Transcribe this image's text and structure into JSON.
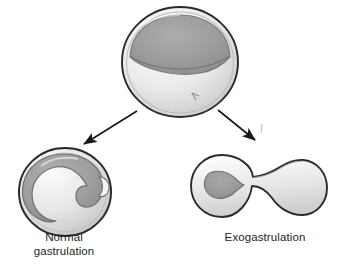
{
  "figure": {
    "background_color": "#ffffff",
    "width": 353,
    "height": 268
  },
  "palette": {
    "outline_dark": "#2b2b2b",
    "outline_mid": "#6e6e6e",
    "outline_light": "#8d8d8d",
    "shell_light": "#f2f2f2",
    "shell_mid": "#d8d8d8",
    "interior_gray": "#9a9a9a",
    "interior_dark": "#8a8a8a",
    "arrow_color": "#1a1a1a",
    "text_color": "#231f20"
  },
  "structures": {
    "blastula": {
      "name": "blastula",
      "label": "",
      "center_x": 180,
      "center_y": 62,
      "radius_x": 58,
      "radius_y": 55,
      "cap_name": "animal-cap",
      "cap_fill": "#9a9a9a",
      "notch_name": "blastopore-notch"
    },
    "normal_gastrula": {
      "name": "normal-gastrula",
      "center_x": 65,
      "center_y": 192,
      "radius_x": 46,
      "radius_y": 44,
      "inner_name": "archenteron-spiral",
      "inner_fill": "#9d9d9d"
    },
    "exogastrula": {
      "name": "exogastrula",
      "left_lobe_center_x": 222,
      "left_lobe_center_y": 186,
      "left_lobe_radius": 31,
      "right_lobe_center_x": 299,
      "right_lobe_center_y": 188,
      "right_lobe_radius": 28,
      "cavity_name": "endoderm-cavity",
      "cavity_fill": "#9a9a9a"
    }
  },
  "arrows": [
    {
      "name": "arrow-to-normal-gastrulation",
      "from_x": 137,
      "from_y": 111,
      "to_x": 82,
      "to_y": 145,
      "direction": "down-left"
    },
    {
      "name": "arrow-to-exogastrulation",
      "from_x": 218,
      "from_y": 110,
      "to_x": 257,
      "to_y": 141,
      "direction": "down-right"
    }
  ],
  "labels": {
    "normal": "Normal\ngastrulation",
    "exogastrulation": "Exogastrulation"
  }
}
